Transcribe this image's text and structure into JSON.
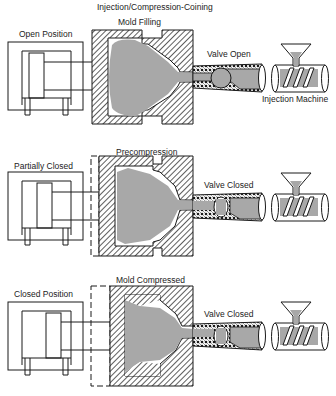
{
  "title": "Injection/Compression-Coining",
  "panels": [
    {
      "stage_label": "Mold Filling",
      "clamp_label": "Open Position",
      "valve_label": "Valve Open",
      "machine_label": "Injection Machine"
    },
    {
      "stage_label": "Precompression",
      "clamp_label": "Partially Closed",
      "valve_label": "Valve Closed"
    },
    {
      "stage_label": "Mold Compressed",
      "clamp_label": "Closed Position",
      "valve_label": "Valve Closed"
    }
  ],
  "colors": {
    "line": "#1a1a1a",
    "melt": "#a8a8a8",
    "background": "#ffffff"
  }
}
